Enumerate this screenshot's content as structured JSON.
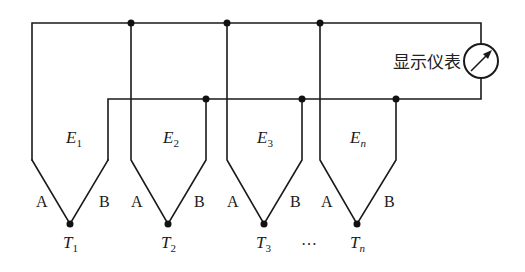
{
  "diagram": {
    "title": "",
    "meter": {
      "label": "显示仪表",
      "icon": "gauge-meter-icon"
    },
    "colors": {
      "line": "#1a1a1a",
      "background": "#ffffff"
    },
    "thermocouples": [
      {
        "emf_main": "E",
        "emf_sub": "1",
        "lead_a": "A",
        "lead_b": "B",
        "junction_main": "T",
        "junction_sub": "1"
      },
      {
        "emf_main": "E",
        "emf_sub": "2",
        "lead_a": "A",
        "lead_b": "B",
        "junction_main": "T",
        "junction_sub": "2"
      },
      {
        "emf_main": "E",
        "emf_sub": "3",
        "lead_a": "A",
        "lead_b": "B",
        "junction_main": "T",
        "junction_sub": "3"
      },
      {
        "emf_main": "E",
        "emf_sub": "n",
        "lead_a": "A",
        "lead_b": "B",
        "junction_main": "T",
        "junction_sub": "n"
      }
    ],
    "ellipsis": "…"
  }
}
